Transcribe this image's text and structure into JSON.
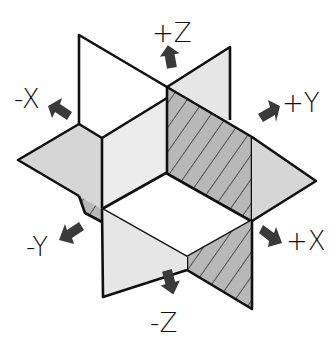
{
  "diagram": {
    "colors": {
      "hatched_plane": "#b8b8b8",
      "light_plane": "#e6e6e6",
      "horizontal_plane": "#d6d6d6",
      "edge": "#111111",
      "arrow": "#3a3a3a",
      "background": "#ffffff"
    },
    "axes": [
      {
        "id": "pos-z",
        "label": "+Z",
        "direction": "up"
      },
      {
        "id": "neg-z",
        "label": "-Z",
        "direction": "down"
      },
      {
        "id": "pos-y",
        "label": "+Y",
        "direction": "upper-right"
      },
      {
        "id": "neg-y",
        "label": "-Y",
        "direction": "lower-left"
      },
      {
        "id": "pos-x",
        "label": "+X",
        "direction": "lower-right"
      },
      {
        "id": "neg-x",
        "label": "-X",
        "direction": "upper-left"
      }
    ],
    "planes": [
      {
        "id": "xz-plane",
        "style": "hatched"
      },
      {
        "id": "yz-plane",
        "style": "light"
      },
      {
        "id": "xy-plane",
        "style": "horizontal"
      }
    ]
  }
}
